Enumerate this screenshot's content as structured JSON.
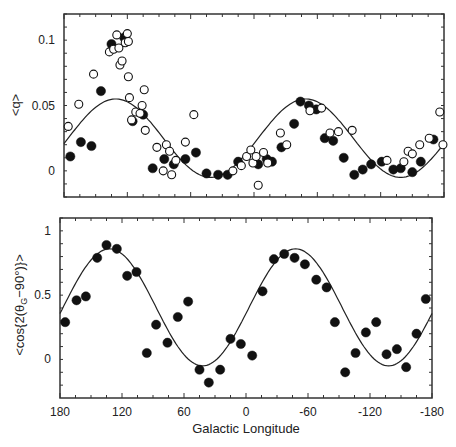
{
  "chart_data": [
    {
      "type": "scatter",
      "panel": "top",
      "title": "",
      "xlabel": "",
      "ylabel": "<q>",
      "xlim": [
        180,
        -180
      ],
      "ylim": [
        -0.02,
        0.12
      ],
      "xticks": [
        180,
        120,
        60,
        0,
        -60,
        -120,
        -180
      ],
      "yticks": [
        0,
        0.05,
        0.1
      ],
      "ytick_labels": [
        "0",
        "0.05",
        "0.1"
      ],
      "grid": false,
      "series": [
        {
          "name": "filled",
          "marker": "filled-circle",
          "points": [
            [
              174,
              0.011
            ],
            [
              164,
              0.022
            ],
            [
              154,
              0.019
            ],
            [
              145,
              0.061
            ],
            [
              135,
              0.097
            ],
            [
              123,
              0.102
            ],
            [
              115,
              0.038
            ],
            [
              105,
              0.043
            ],
            [
              96,
              0.002
            ],
            [
              85,
              0.009
            ],
            [
              76,
              0.005
            ],
            [
              65,
              0.009
            ],
            [
              55,
              0.014
            ],
            [
              45,
              -0.002
            ],
            [
              34,
              -0.003
            ],
            [
              25,
              -0.003
            ],
            [
              15,
              0.007
            ],
            [
              -4,
              0.005
            ],
            [
              -12,
              0.009
            ],
            [
              -17,
              0.007
            ],
            [
              -26,
              0.018
            ],
            [
              -38,
              0.036
            ],
            [
              -44,
              0.053
            ],
            [
              -52,
              0.05
            ],
            [
              -59,
              0.047
            ],
            [
              -67,
              0.025
            ],
            [
              -75,
              0.023
            ],
            [
              -85,
              0.01
            ],
            [
              -95,
              -0.003
            ],
            [
              -103,
              0.001
            ],
            [
              -111,
              0.005
            ],
            [
              -121,
              0.007
            ],
            [
              -132,
              0.001
            ],
            [
              -139,
              0.002
            ],
            [
              -150,
              -0.001
            ],
            [
              -158,
              0.007
            ],
            [
              -170,
              0.024
            ]
          ]
        },
        {
          "name": "open",
          "marker": "open-circle",
          "points": [
            [
              176,
              0.034
            ],
            [
              166,
              0.051
            ],
            [
              152,
              0.074
            ],
            [
              137,
              0.091
            ],
            [
              133,
              0.093
            ],
            [
              130,
              0.104
            ],
            [
              128,
              0.094
            ],
            [
              127,
              0.081
            ],
            [
              125,
              0.084
            ],
            [
              122,
              0.098
            ],
            [
              120,
              0.105
            ],
            [
              119,
              0.099
            ],
            [
              119,
              0.072
            ],
            [
              118,
              0.056
            ],
            [
              116,
              0.039
            ],
            [
              112,
              0.045
            ],
            [
              108,
              0.044
            ],
            [
              106,
              0.05
            ],
            [
              104,
              0.062
            ],
            [
              103,
              0.031
            ],
            [
              92,
              0.018
            ],
            [
              86,
              0.0
            ],
            [
              83,
              0.02
            ],
            [
              80,
              0.015
            ],
            [
              78,
              -0.003
            ],
            [
              74,
              0.008
            ],
            [
              65,
              0.022
            ],
            [
              57,
              0.043
            ],
            [
              20,
              0.0
            ],
            [
              12,
              0.004
            ],
            [
              7,
              0.011
            ],
            [
              3,
              0.016
            ],
            [
              1,
              0.006
            ],
            [
              -2,
              0.011
            ],
            [
              -4,
              -0.011
            ],
            [
              -9,
              0.014
            ],
            [
              -13,
              0.006
            ],
            [
              -25,
              0.029
            ],
            [
              -31,
              0.02
            ],
            [
              -53,
              0.046
            ],
            [
              -64,
              0.048
            ],
            [
              -72,
              0.029
            ],
            [
              -80,
              0.03
            ],
            [
              -93,
              0.031
            ],
            [
              -126,
              0.008
            ],
            [
              -142,
              0.007
            ],
            [
              -146,
              0.015
            ],
            [
              -150,
              0.013
            ],
            [
              -157,
              0.02
            ],
            [
              -166,
              0.025
            ],
            [
              -176,
              0.045
            ],
            [
              -179,
              0.02
            ]
          ]
        }
      ],
      "fit_curve": {
        "name": "model",
        "form": "offset + amplitude*cos(2*(l - l0))",
        "peaks_at_longitude": [
          131,
          -49
        ],
        "max": 0.055,
        "min": -0.005
      }
    },
    {
      "type": "scatter",
      "panel": "bottom",
      "title": "",
      "xlabel": "Galactic Longitude",
      "ylabel": "<cos{2(θG−90°)}>",
      "xlim": [
        180,
        -180
      ],
      "ylim": [
        -0.3,
        1.1
      ],
      "xticks": [
        180,
        120,
        60,
        0,
        -60,
        -120,
        -180
      ],
      "xtick_labels": [
        "180",
        "120",
        "60",
        "0",
        "-60",
        "-120",
        "-180"
      ],
      "yticks": [
        0,
        0.5,
        1
      ],
      "ytick_labels": [
        "0",
        "0.5",
        "1"
      ],
      "grid": false,
      "series": [
        {
          "name": "filled",
          "marker": "filled-circle",
          "points": [
            [
              175,
              0.29
            ],
            [
              164,
              0.46
            ],
            [
              155,
              0.49
            ],
            [
              144,
              0.79
            ],
            [
              135,
              0.89
            ],
            [
              125,
              0.86
            ],
            [
              115,
              0.65
            ],
            [
              106,
              0.68
            ],
            [
              96,
              0.05
            ],
            [
              87,
              0.27
            ],
            [
              76,
              0.13
            ],
            [
              66,
              0.33
            ],
            [
              56,
              0.45
            ],
            [
              45,
              -0.08
            ],
            [
              36,
              -0.18
            ],
            [
              25,
              -0.08
            ],
            [
              15,
              0.16
            ],
            [
              5,
              0.12
            ],
            [
              -6,
              0.03
            ],
            [
              -16,
              0.53
            ],
            [
              -27,
              0.78
            ],
            [
              -37,
              0.82
            ],
            [
              -47,
              0.79
            ],
            [
              -57,
              0.74
            ],
            [
              -68,
              0.62
            ],
            [
              -78,
              0.56
            ],
            [
              -86,
              0.29
            ],
            [
              -96,
              -0.1
            ],
            [
              -106,
              0.05
            ],
            [
              -116,
              0.21
            ],
            [
              -126,
              0.29
            ],
            [
              -136,
              0.04
            ],
            [
              -146,
              0.08
            ],
            [
              -155,
              -0.06
            ],
            [
              -165,
              0.2
            ],
            [
              -174,
              0.47
            ]
          ]
        }
      ],
      "fit_curve": {
        "name": "model",
        "form": "offset + amplitude*cos(2*(l - l0))",
        "peaks_at_longitude": [
          132,
          -45
        ],
        "max": 0.86,
        "min": -0.05
      }
    }
  ],
  "labels": {
    "top_ylabel": "<q>",
    "bottom_ylabel_main": "<cos{2(θ",
    "bottom_ylabel_sub": "G",
    "bottom_ylabel_end": "−90°)}>",
    "xlabel": "Galactic Longitude"
  },
  "style": {
    "line_color": "#222222",
    "marker_color": "#111111",
    "frame_color": "#333333",
    "background": "#ffffff"
  }
}
